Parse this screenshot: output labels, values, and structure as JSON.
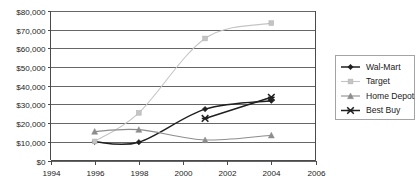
{
  "chart_data": {
    "type": "line",
    "title": "",
    "subtitle": "",
    "xlabel": "",
    "ylabel": "",
    "xlim": [
      1994,
      2006
    ],
    "ylim": [
      0,
      80000
    ],
    "grid": true,
    "legend_position": "right",
    "x_tick_labels": [
      "1994",
      "1996",
      "1998",
      "2000",
      "2002",
      "2004",
      "2006"
    ],
    "x_ticks": [
      1994,
      1996,
      1998,
      2000,
      2002,
      2004,
      2006
    ],
    "y_tick_labels": [
      "$0",
      "$10,000",
      "$20,000",
      "$30,000",
      "$40,000",
      "$50,000",
      "$60,000",
      "$70,000",
      "$80,000"
    ],
    "y_ticks": [
      0,
      10000,
      20000,
      30000,
      40000,
      50000,
      60000,
      70000,
      80000
    ],
    "series": [
      {
        "name": "Wal-Mart",
        "marker": "diamond",
        "color": "#1f1f1f",
        "x": [
          1996,
          1998,
          2001,
          2004
        ],
        "values": [
          10000,
          9800,
          27500,
          32000
        ]
      },
      {
        "name": "Target",
        "marker": "square",
        "color": "#c4c4c4",
        "x": [
          1996,
          1998,
          2001,
          2004
        ],
        "values": [
          10200,
          25500,
          65300,
          73500
        ]
      },
      {
        "name": "Home Depot",
        "marker": "triangle",
        "color": "#8d8d8d",
        "x": [
          1996,
          1998,
          2001,
          2004
        ],
        "values": [
          15500,
          16500,
          11000,
          13500
        ]
      },
      {
        "name": "Best Buy",
        "marker": "star",
        "color": "#1f1f1f",
        "x": [
          2001,
          2004
        ],
        "values": [
          22500,
          33800
        ]
      }
    ]
  },
  "legend": {
    "entries": [
      {
        "label": "Wal-Mart"
      },
      {
        "label": "Target"
      },
      {
        "label": "Home Depot"
      },
      {
        "label": "Best Buy"
      }
    ]
  },
  "colors": {
    "gridline": "#555555",
    "axis": "#4a4a4a",
    "background": "#ffffff",
    "text": "#1a1a1a",
    "legend_border": "#9a9a9a"
  }
}
